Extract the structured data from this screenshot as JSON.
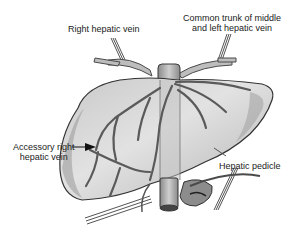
{
  "figure": {
    "labels": {
      "right_hepatic_vein": "Right hepatic vein",
      "common_trunk_line1": "Common trunk of middle",
      "common_trunk_line2": "and left hepatic vein",
      "accessory_line1": "Accessory right",
      "accessory_line2": "hepatic vein",
      "hepatic_pedicle": "Hepatic pedicle"
    },
    "colors": {
      "background": "#ffffff",
      "liver_fill": "#d9d9d9",
      "liver_shade": "#a8a8a8",
      "outline": "#3a3a3a",
      "vessel": "#6e6e6e",
      "text": "#222222"
    }
  }
}
